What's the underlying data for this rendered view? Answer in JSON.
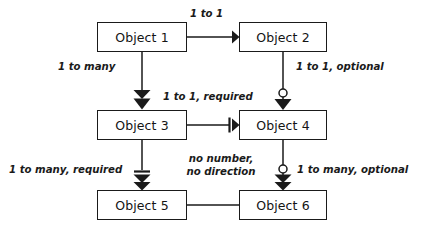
{
  "diagram": {
    "type": "entity-relationship-notation",
    "stroke_color": "#1a1a1a",
    "fill_color": "#ffffff",
    "nodes": [
      {
        "id": "object1",
        "label": "Object 1",
        "x": 97,
        "y": 22,
        "w": 90,
        "h": 30
      },
      {
        "id": "object2",
        "label": "Object 2",
        "x": 239,
        "y": 22,
        "w": 88,
        "h": 30
      },
      {
        "id": "object3",
        "label": "Object 3",
        "x": 97,
        "y": 110,
        "w": 90,
        "h": 30
      },
      {
        "id": "object4",
        "label": "Object 4",
        "x": 239,
        "y": 110,
        "w": 88,
        "h": 30
      },
      {
        "id": "object5",
        "label": "Object 5",
        "x": 97,
        "y": 190,
        "w": 90,
        "h": 30
      },
      {
        "id": "object6",
        "label": "Object 6",
        "x": 239,
        "y": 190,
        "w": 88,
        "h": 30
      }
    ],
    "edges": [
      {
        "id": "edge-1-to-2",
        "from": "object1",
        "to": "object2",
        "label": "1 to 1",
        "cardinality": "one",
        "required": false,
        "optional": false,
        "directed": true
      },
      {
        "id": "edge-1-to-3",
        "from": "object1",
        "to": "object3",
        "label": "1 to many",
        "cardinality": "many",
        "required": false,
        "optional": false,
        "directed": true
      },
      {
        "id": "edge-2-to-4",
        "from": "object2",
        "to": "object4",
        "label": "1 to 1, optional",
        "cardinality": "one",
        "required": false,
        "optional": true,
        "directed": true
      },
      {
        "id": "edge-3-to-4",
        "from": "object3",
        "to": "object4",
        "label": "1 to 1, required",
        "cardinality": "one",
        "required": true,
        "optional": false,
        "directed": true
      },
      {
        "id": "edge-3-to-5",
        "from": "object3",
        "to": "object5",
        "label": "1 to many, required",
        "cardinality": "many",
        "required": true,
        "optional": false,
        "directed": true
      },
      {
        "id": "edge-4-to-6",
        "from": "object4",
        "to": "object6",
        "label": "1 to many, optional",
        "cardinality": "many",
        "required": false,
        "optional": true,
        "directed": true
      },
      {
        "id": "edge-5-to-6",
        "from": "object5",
        "to": "object6",
        "label": "no number,\nno direction",
        "label_line1": "no number,",
        "label_line2": "no direction",
        "cardinality": "none",
        "required": false,
        "optional": false,
        "directed": false
      }
    ]
  }
}
